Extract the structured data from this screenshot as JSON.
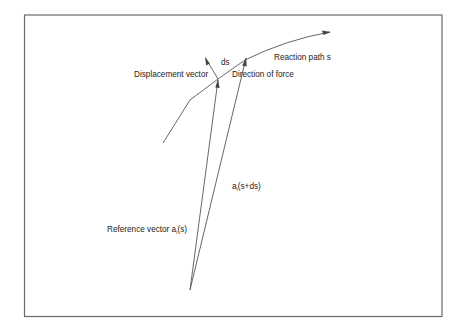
{
  "diagram": {
    "labels": {
      "reaction_path": "Reaction path s",
      "ds": "ds",
      "displacement_vector": "Displacement vector",
      "direction_of_force": "Direction of force",
      "reference_vector_prefix": "Reference vector a",
      "reference_vector_sub": "i",
      "reference_vector_suffix": "(s)",
      "next_vector_prefix": "a",
      "next_vector_sub": "i",
      "next_vector_suffix": "(s+ds)"
    },
    "colors": {
      "line": "#555555",
      "frame": "#6a6a6a",
      "text": "#222222",
      "background": "#ffffff"
    },
    "geometry": {
      "frame": {
        "x": 24,
        "y": 15,
        "width": 418,
        "height": 302
      },
      "origin": [
        190,
        290
      ],
      "reaction_path_points": [
        [
          163,
          143
        ],
        [
          190,
          100
        ],
        [
          218,
          79
        ],
        [
          245,
          60
        ],
        [
          280,
          45
        ],
        [
          315,
          36
        ],
        [
          330,
          32
        ]
      ],
      "reference_vector_tip": [
        218,
        80
      ],
      "next_vector_tip": [
        246,
        58
      ],
      "displacement_arrow": {
        "from": [
          218,
          79
        ],
        "to": [
          205,
          57
        ]
      }
    }
  }
}
